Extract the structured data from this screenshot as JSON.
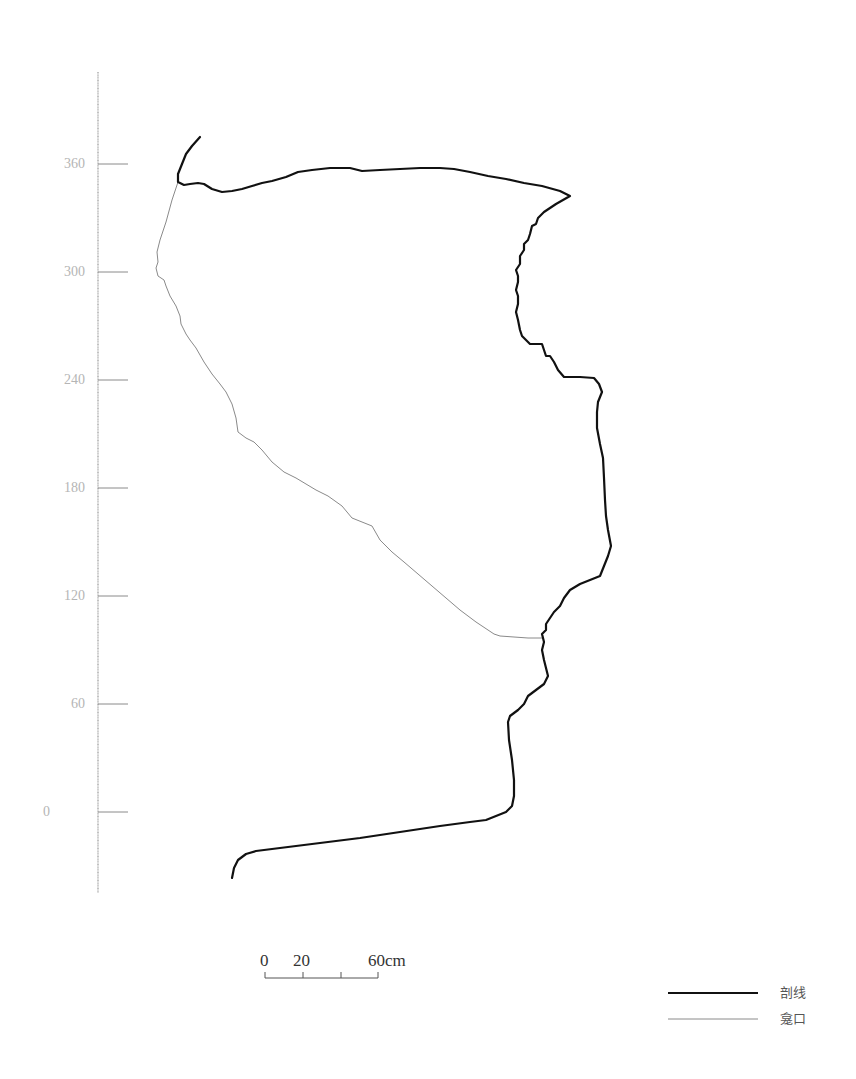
{
  "figure": {
    "type": "archaeological-section-profile",
    "units": "cm"
  },
  "axis": {
    "ticks": [
      {
        "label": "360",
        "value": 360
      },
      {
        "label": "300",
        "value": 300
      },
      {
        "label": "240",
        "value": 240
      },
      {
        "label": "180",
        "value": 180
      },
      {
        "label": "120",
        "value": 120
      },
      {
        "label": "60",
        "value": 60
      },
      {
        "label": "0",
        "value": 0
      }
    ]
  },
  "scale_bar": {
    "labels": [
      "0",
      "20",
      "60cm"
    ],
    "values": [
      0,
      20,
      40,
      60
    ]
  },
  "legend": {
    "items": [
      {
        "label": "剖线",
        "style": "thick",
        "color": "#111111"
      },
      {
        "label": "龛口",
        "style": "thin",
        "color": "#888888"
      }
    ]
  },
  "colors": {
    "profile_line": "#111111",
    "niche_line": "#8a8a8a",
    "axis": "#999999",
    "tick_label": "#b5b5b5"
  }
}
